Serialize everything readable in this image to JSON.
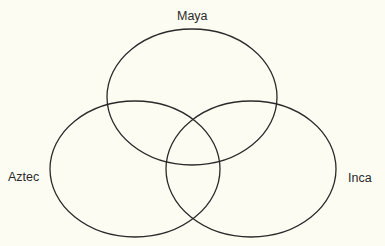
{
  "diagram": {
    "type": "venn",
    "stroke_color": "#2a2a2a",
    "background": "#fcfcf2",
    "sets": [
      {
        "label": "Maya",
        "cx": 192,
        "cy": 97,
        "rx": 85,
        "ry": 68
      },
      {
        "label": "Aztec",
        "cx": 135,
        "cy": 169,
        "rx": 85,
        "ry": 68
      },
      {
        "label": "Inca",
        "cx": 251,
        "cy": 169,
        "rx": 85,
        "ry": 68
      }
    ]
  }
}
